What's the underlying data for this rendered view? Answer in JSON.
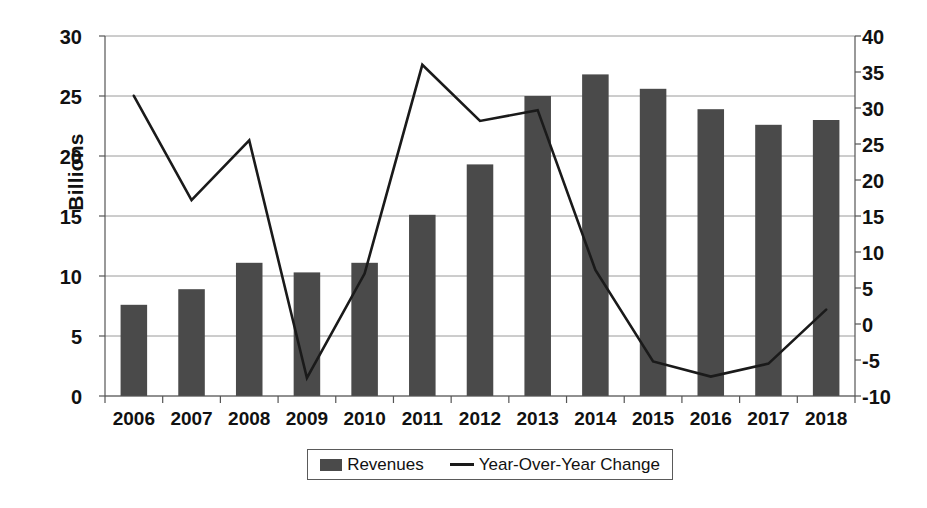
{
  "chart_data": {
    "type": "bar",
    "title": "",
    "xlabel": "",
    "ylabel": "Billions",
    "y2label": "",
    "categories": [
      "2006",
      "2007",
      "2008",
      "2009",
      "2010",
      "2011",
      "2012",
      "2013",
      "2014",
      "2015",
      "2016",
      "2017",
      "2018"
    ],
    "ylim": [
      0,
      30
    ],
    "yticks": [
      0,
      5,
      10,
      15,
      20,
      25,
      30
    ],
    "y2lim": [
      -10,
      40
    ],
    "y2ticks": [
      -10,
      -5,
      0,
      5,
      10,
      15,
      20,
      25,
      30,
      35,
      40
    ],
    "grid": true,
    "legend_position": "bottom",
    "series": [
      {
        "name": "Revenues",
        "type": "bar",
        "axis": "left",
        "color": "#4a4a4a",
        "values": [
          7.6,
          8.9,
          11.1,
          10.3,
          11.1,
          15.1,
          19.3,
          25.0,
          26.8,
          25.6,
          23.9,
          22.6,
          23.0
        ]
      },
      {
        "name": "Year-Over-Year Change",
        "type": "line",
        "axis": "right",
        "color": "#1a1a1a",
        "values": [
          31.7,
          17.2,
          25.5,
          -7.5,
          7.0,
          36.0,
          28.2,
          29.7,
          7.5,
          -5.2,
          -7.3,
          -5.5,
          2.0
        ]
      }
    ]
  },
  "axes": {
    "left_ticks": [
      "30",
      "25",
      "20",
      "15",
      "10",
      "5",
      "0"
    ],
    "right_ticks": [
      "40",
      "35",
      "30",
      "25",
      "20",
      "15",
      "10",
      "5",
      "0",
      "-5",
      "-10"
    ],
    "x_ticks": [
      "2006",
      "2007",
      "2008",
      "2009",
      "2010",
      "2011",
      "2012",
      "2013",
      "2014",
      "2015",
      "2016",
      "2017",
      "2018"
    ],
    "y_axis_title": "Billions"
  },
  "legend": {
    "items": [
      {
        "label": "Revenues",
        "marker": "bar-swatch-icon"
      },
      {
        "label": "Year-Over-Year Change",
        "marker": "line-swatch-icon"
      }
    ]
  },
  "colors": {
    "bar": "#4a4a4a",
    "line": "#1a1a1a",
    "grid": "#9a9a9a",
    "axis": "#555555",
    "background": "#ffffff"
  }
}
